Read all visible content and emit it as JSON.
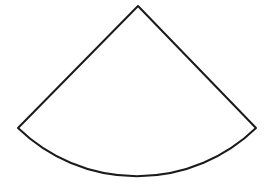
{
  "diagram": {
    "type": "circular-sector",
    "stroke_color": "#1a1a1a",
    "fill_color": "#ffffff",
    "stroke_width": 2,
    "apex": [
      138,
      6
    ],
    "left_corner": [
      18,
      128
    ],
    "right_corner": [
      256,
      128
    ],
    "radius": 171
  }
}
